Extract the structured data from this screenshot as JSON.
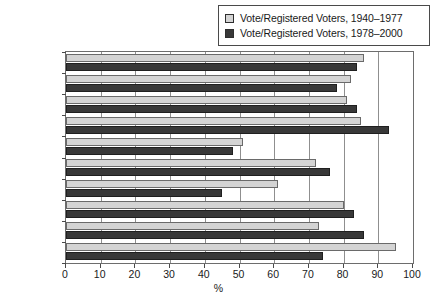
{
  "chart_data": {
    "type": "bar",
    "orientation": "horizontal",
    "title": "",
    "xlabel": "%",
    "ylabel": "",
    "xlim": [
      0,
      100
    ],
    "xticks": [
      "0",
      "10",
      "20",
      "30",
      "40",
      "50",
      "60",
      "70",
      "80",
      "90",
      "100"
    ],
    "grid": true,
    "legend_position": "top-right",
    "categories": [
      "Argentina",
      "Bolivia",
      "Brazil",
      "Chile",
      "Colombia",
      "Ecuador",
      "Guatemala",
      "Peru",
      "Uruguay",
      "Venezuela"
    ],
    "series": [
      {
        "name": "Vote/Registered Voters, 1940–1977",
        "color": "#d4d4d4",
        "values": [
          86,
          82,
          81,
          85,
          51,
          72,
          61,
          80,
          73,
          95
        ]
      },
      {
        "name": "Vote/Registered Voters, 1978–2000",
        "color": "#383838",
        "values": [
          84,
          78,
          84,
          93,
          48,
          76,
          45,
          83,
          86,
          74
        ]
      }
    ]
  },
  "legend": {
    "entries": [
      {
        "label": "Vote/Registered Voters, 1940–1977",
        "swatch": "#d4d4d4"
      },
      {
        "label": "Vote/Registered Voters, 1978–2000",
        "swatch": "#383838"
      }
    ]
  },
  "axis": {
    "x_title": "%",
    "x_ticks": [
      "0",
      "10",
      "20",
      "30",
      "40",
      "50",
      "60",
      "70",
      "80",
      "90",
      "100"
    ]
  }
}
